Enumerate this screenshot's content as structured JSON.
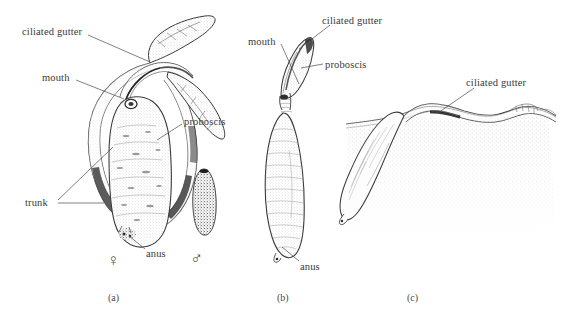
{
  "figure": {
    "background_color": "#ffffff",
    "ink_color": "#3a3a3a",
    "panels": [
      {
        "id": "a",
        "caption": "(a)",
        "caption_pos": {
          "x": 108,
          "y": 292
        },
        "subject": "female echiuran with extended bifurcated proboscis and dwarf male",
        "labels": [
          {
            "name": "ciliated-gutter",
            "text": "ciliated gutter",
            "x": 22,
            "y": 27,
            "leader": [
              [
                88,
                35
              ],
              [
                118,
                48
              ],
              [
                150,
                62
              ]
            ]
          },
          {
            "name": "mouth",
            "text": "mouth",
            "x": 42,
            "y": 73,
            "leader": [
              [
                76,
                80
              ],
              [
                108,
                90
              ],
              [
                124,
                98
              ]
            ]
          },
          {
            "name": "proboscis",
            "text": "proboscis",
            "x": 184,
            "y": 117,
            "leader": [
              [
                182,
                125
              ],
              [
                168,
                134
              ],
              [
                156,
                141
              ]
            ]
          },
          {
            "name": "trunk",
            "text": "trunk",
            "x": 25,
            "y": 198,
            "leader": [
              [
                58,
                203
              ],
              [
                88,
                203
              ],
              [
                103,
                203
              ]
            ]
          },
          {
            "name": "trunk-upper",
            "text": "",
            "x": 0,
            "y": 0,
            "leader": [
              [
                58,
                200
              ],
              [
                88,
                175
              ],
              [
                112,
                148
              ]
            ]
          },
          {
            "name": "anus",
            "text": "anus",
            "x": 146,
            "y": 249,
            "leader": [
              [
                144,
                249
              ],
              [
                132,
                242
              ],
              [
                122,
                236
              ]
            ]
          }
        ],
        "symbols": [
          {
            "name": "female-symbol",
            "glyph": "♀",
            "x": 107,
            "y": 252
          },
          {
            "name": "male-symbol",
            "glyph": "♂",
            "x": 190,
            "y": 250
          }
        ]
      },
      {
        "id": "b",
        "caption": "(b)",
        "caption_pos": {
          "x": 277,
          "y": 292
        },
        "subject": "female echiuran with contracted proboscis",
        "labels": [
          {
            "name": "ciliated-gutter",
            "text": "ciliated gutter",
            "x": 322,
            "y": 16,
            "leader": [
              [
                330,
                25
              ],
              [
                310,
                40
              ],
              [
                297,
                50
              ]
            ]
          },
          {
            "name": "mouth",
            "text": "mouth",
            "x": 248,
            "y": 37,
            "leader": [
              [
                282,
                45
              ],
              [
                295,
                62
              ],
              [
                300,
                80
              ]
            ]
          },
          {
            "name": "proboscis",
            "text": "proboscis",
            "x": 325,
            "y": 60,
            "leader": [
              [
                322,
                64
              ],
              [
                312,
                66
              ],
              [
                302,
                68
              ]
            ]
          },
          {
            "name": "anus",
            "text": "anus",
            "x": 300,
            "y": 262,
            "leader": [
              [
                298,
                261
              ],
              [
                288,
                252
              ],
              [
                281,
                246
              ]
            ]
          }
        ],
        "symbols": []
      },
      {
        "id": "c",
        "caption": "(c)",
        "caption_pos": {
          "x": 407,
          "y": 292
        },
        "subject": "female echiuran buried in sediment with proboscis extended over the surface",
        "labels": [
          {
            "name": "ciliated-gutter",
            "text": "ciliated gutter",
            "x": 466,
            "y": 78,
            "leader": [
              [
                474,
                87
              ],
              [
                450,
                103
              ],
              [
                437,
                112
              ]
            ]
          }
        ],
        "symbols": []
      }
    ]
  }
}
